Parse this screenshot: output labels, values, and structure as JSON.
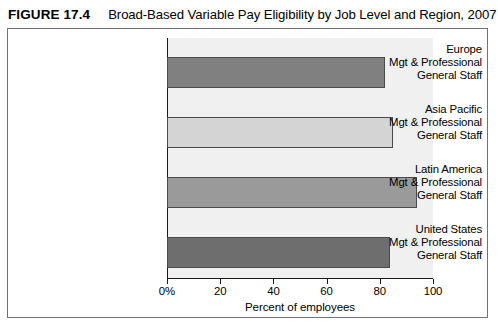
{
  "header": {
    "figure_number": "FIGURE 17.4",
    "title": "Broad-Based Variable Pay Eligibility by Job Level and Region, 2007"
  },
  "chart_data": {
    "type": "bar",
    "orientation": "horizontal",
    "title": "Broad-Based Variable Pay Eligibility by Job Level and Region, 2007",
    "xlabel": "Percent of employees",
    "ylabel": "",
    "xlim": [
      0,
      100
    ],
    "xticks": [
      {
        "value": 0,
        "label": "0%"
      },
      {
        "value": 20,
        "label": "20"
      },
      {
        "value": 40,
        "label": "40"
      },
      {
        "value": 60,
        "label": "60"
      },
      {
        "value": 80,
        "label": "80"
      },
      {
        "value": 100,
        "label": "100"
      }
    ],
    "grid": false,
    "legend": "none",
    "panel_color": "#f0f0f0",
    "categories": [
      {
        "region": "Europe",
        "line2": "Mgt & Professional",
        "line3": "General Staff",
        "value": 82,
        "color": "#808080"
      },
      {
        "region": "Asia Pacific",
        "line2": "Mgt & Professional",
        "line3": "General Staff",
        "value": 85,
        "color": "#d4d4d4"
      },
      {
        "region": "Latin America",
        "line2": "Mgt & Professional",
        "line3": "General Staff",
        "value": 94,
        "color": "#9a9a9a"
      },
      {
        "region": "United States",
        "line2": "Mgt & Professional",
        "line3": "General Staff",
        "value": 84,
        "color": "#6e6e6e"
      }
    ]
  }
}
